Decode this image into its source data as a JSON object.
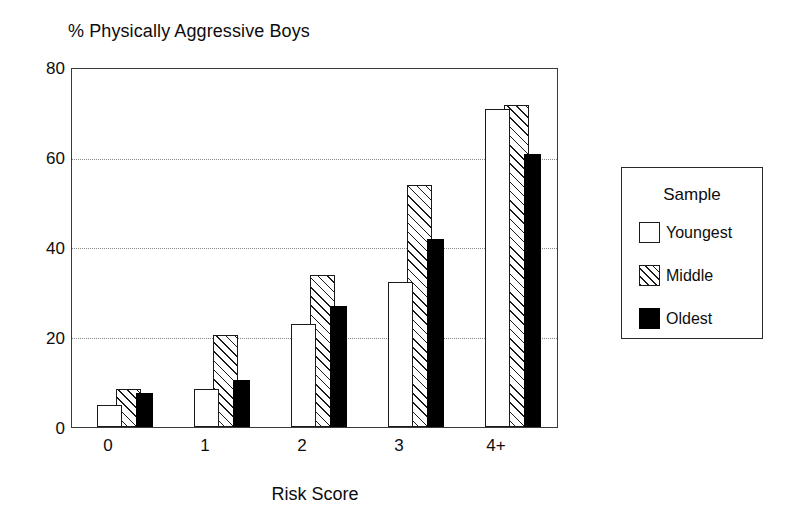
{
  "chart_data": {
    "type": "bar",
    "title": "% Physically Aggressive Boys",
    "xlabel": "Risk Score",
    "ylabel": "",
    "categories": [
      "0",
      "1",
      "2",
      "3",
      "4+"
    ],
    "series": [
      {
        "name": "Youngest",
        "values": [
          5,
          8.5,
          23,
          32.5,
          71
        ],
        "fill": "white",
        "edge": "#000000"
      },
      {
        "name": "Middle",
        "values": [
          8.5,
          20.5,
          34,
          54,
          72
        ],
        "fill": "hatched",
        "edge": "#000000"
      },
      {
        "name": "Oldest",
        "values": [
          7.5,
          10.5,
          27,
          42,
          61
        ],
        "fill": "black",
        "edge": "#000000"
      }
    ],
    "ylim": [
      0,
      80
    ],
    "yticks": [
      0,
      20,
      40,
      60,
      80
    ],
    "ytick_labels": [
      "0",
      "20",
      "40",
      "60",
      "80"
    ],
    "gridlines": [
      20,
      40,
      60
    ],
    "grid": true,
    "grid_style": "dotted",
    "legend_position": "right-outside",
    "legend_title": "Sample"
  },
  "legend": {
    "title": "Sample",
    "entries": [
      {
        "label": "Youngest",
        "swatch": "white-square-icon"
      },
      {
        "label": "Middle",
        "swatch": "hatched-square-icon"
      },
      {
        "label": "Oldest",
        "swatch": "black-square-icon"
      }
    ]
  },
  "axes": {
    "y_tick_labels": [
      "80",
      "60",
      "40",
      "20",
      "0"
    ],
    "x_tick_labels": [
      "0",
      "1",
      "2",
      "3",
      "4+"
    ],
    "x_axis_title": "Risk Score",
    "chart_title": "% Physically Aggressive Boys"
  }
}
